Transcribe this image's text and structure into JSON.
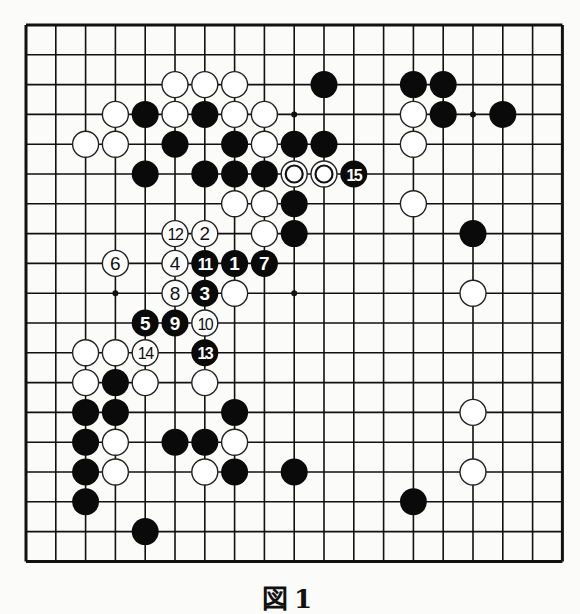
{
  "diagram": {
    "type": "go-board",
    "size": 19,
    "caption": "図1",
    "colors": {
      "line": "#111111",
      "black": "#0a0a0a",
      "white": "#ffffff",
      "paper": "#fbfbf9"
    },
    "hoshi": [
      [
        3,
        3
      ],
      [
        9,
        3
      ],
      [
        15,
        3
      ],
      [
        3,
        9
      ],
      [
        9,
        9
      ],
      [
        15,
        9
      ],
      [
        3,
        15
      ],
      [
        9,
        15
      ],
      [
        15,
        15
      ]
    ],
    "black_stones": [
      [
        10,
        2
      ],
      [
        13,
        2
      ],
      [
        14,
        2
      ],
      [
        4,
        3
      ],
      [
        6,
        3
      ],
      [
        14,
        3
      ],
      [
        16,
        3
      ],
      [
        5,
        4
      ],
      [
        7,
        4
      ],
      [
        9,
        4
      ],
      [
        10,
        4
      ],
      [
        4,
        5
      ],
      [
        6,
        5
      ],
      [
        7,
        5
      ],
      [
        8,
        5
      ],
      [
        9,
        6
      ],
      [
        9,
        7
      ],
      [
        15,
        7
      ],
      [
        3,
        12
      ],
      [
        2,
        13
      ],
      [
        3,
        13
      ],
      [
        7,
        13
      ],
      [
        2,
        14
      ],
      [
        5,
        14
      ],
      [
        6,
        14
      ],
      [
        2,
        15
      ],
      [
        7,
        15
      ],
      [
        9,
        15
      ],
      [
        2,
        16
      ],
      [
        13,
        16
      ],
      [
        4,
        17
      ]
    ],
    "white_stones": [
      [
        5,
        2
      ],
      [
        6,
        2
      ],
      [
        7,
        2
      ],
      [
        3,
        3
      ],
      [
        5,
        3
      ],
      [
        7,
        3
      ],
      [
        8,
        3
      ],
      [
        13,
        3
      ],
      [
        2,
        4
      ],
      [
        3,
        4
      ],
      [
        8,
        4
      ],
      [
        13,
        4
      ],
      [
        7,
        6
      ],
      [
        8,
        6
      ],
      [
        13,
        6
      ],
      [
        8,
        7
      ],
      [
        7,
        9
      ],
      [
        15,
        9
      ],
      [
        2,
        11
      ],
      [
        3,
        11
      ],
      [
        2,
        12
      ],
      [
        4,
        12
      ],
      [
        6,
        12
      ],
      [
        15,
        13
      ],
      [
        3,
        14
      ],
      [
        7,
        14
      ],
      [
        3,
        15
      ],
      [
        6,
        15
      ],
      [
        15,
        15
      ]
    ],
    "marked_white_stones": [
      [
        9,
        5
      ],
      [
        10,
        5
      ]
    ],
    "numbered_moves": [
      {
        "n": "1",
        "color": "black",
        "c": 7,
        "r": 8
      },
      {
        "n": "2",
        "color": "white",
        "c": 6,
        "r": 7
      },
      {
        "n": "3",
        "color": "black",
        "c": 6,
        "r": 9
      },
      {
        "n": "4",
        "color": "white",
        "c": 5,
        "r": 8
      },
      {
        "n": "5",
        "color": "black",
        "c": 4,
        "r": 10
      },
      {
        "n": "6",
        "color": "white",
        "c": 3,
        "r": 8
      },
      {
        "n": "7",
        "color": "black",
        "c": 8,
        "r": 8
      },
      {
        "n": "8",
        "color": "white",
        "c": 5,
        "r": 9
      },
      {
        "n": "9",
        "color": "black",
        "c": 5,
        "r": 10
      },
      {
        "n": "10",
        "color": "white",
        "c": 6,
        "r": 10
      },
      {
        "n": "11",
        "color": "black",
        "c": 6,
        "r": 8
      },
      {
        "n": "12",
        "color": "white",
        "c": 5,
        "r": 7
      },
      {
        "n": "13",
        "color": "black",
        "c": 6,
        "r": 11
      },
      {
        "n": "14",
        "color": "white",
        "c": 4,
        "r": 11
      },
      {
        "n": "15",
        "color": "black",
        "c": 11,
        "r": 5
      }
    ]
  }
}
